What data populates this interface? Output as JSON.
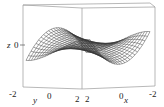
{
  "chart_data": {
    "type": "surface3d",
    "title": "",
    "xlabel": "x",
    "ylabel": "y",
    "zlabel": "z",
    "x_ticks": [
      "2",
      "0",
      "-2"
    ],
    "y_ticks": [
      "-2",
      "0",
      "2"
    ],
    "z_ticks": [
      "0"
    ],
    "xlim": [
      -2,
      2
    ],
    "ylim": [
      -2,
      2
    ],
    "grid": false,
    "legend": null,
    "colors": {
      "mesh": "#333333",
      "box": "#888888",
      "background": "#ffffff"
    }
  },
  "labels": {
    "z_axis": "z",
    "z_tick": "0",
    "y_axis": "y",
    "y_tick_neg": "-2",
    "y_tick_zero": "0",
    "y_tick_pos": "2",
    "x_axis": "x",
    "x_tick_pos": "2",
    "x_tick_zero": "0",
    "x_tick_neg": "-2"
  }
}
